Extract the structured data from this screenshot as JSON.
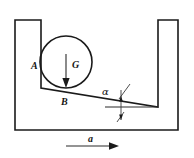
{
  "figure": {
    "background_color": "#ffffff",
    "line_color": "#1a1a1a",
    "labels": {
      "contact_wall": "A",
      "contact_floor": "B",
      "weight_vector": "G",
      "incline_angle": "α",
      "acceleration": "a"
    },
    "geometry": {
      "container": {
        "outer_left_x": 15,
        "outer_right_x": 178,
        "outer_top_y": 20,
        "outer_bottom_y": 130,
        "inner_left_x": 41,
        "inner_right_x": 158,
        "wall_thickness": 26
      },
      "ball": {
        "center_x": 66,
        "center_y": 62,
        "radius": 26
      },
      "incline": {
        "left_x": 41,
        "left_y": 88,
        "right_x": 158,
        "right_y": 107
      },
      "reference_line": {
        "x1": 105,
        "y1": 107,
        "x2": 158,
        "y2": 107
      },
      "weight_arrow": {
        "x": 66,
        "y_start": 54,
        "y_end": 86
      },
      "acceleration_arrow": {
        "x_start": 66,
        "x_end": 118,
        "y": 146
      }
    }
  }
}
